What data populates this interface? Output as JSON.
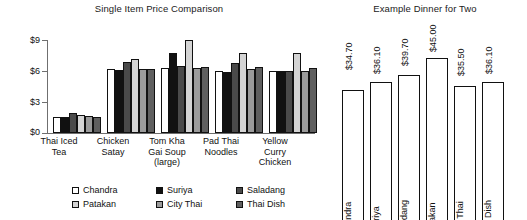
{
  "left": {
    "title": "Single Item Price Comparison",
    "y_ticks": [
      "$9",
      "$6",
      "$3",
      "$0"
    ],
    "categories": [
      "Thai Iced\nTea",
      "Chicken\nSatay",
      "Tom Kha\nGai Soup\n(large)",
      "Pad Thai\nNoodles",
      "Yellow\nCurry\nChicken"
    ],
    "legend": [
      {
        "label": "Chandra",
        "color": "#ffffff"
      },
      {
        "label": "Suriya",
        "color": "#111111"
      },
      {
        "label": "Saladang",
        "color": "#4a4a4a"
      },
      {
        "label": "Patakan",
        "color": "#d4d4d4"
      },
      {
        "label": "City Thai",
        "color": "#9b9b9b"
      },
      {
        "label": "Thai Dish",
        "color": "#5f5f5f"
      }
    ]
  },
  "right": {
    "title": "Example Dinner for Two",
    "bars": [
      {
        "name": "Chandra",
        "value_label": "$34.70",
        "value": 34.7
      },
      {
        "name": "Suriya",
        "value_label": "$36.10",
        "value": 36.1
      },
      {
        "name": "Saladang",
        "value_label": "$39.70",
        "value": 39.7
      },
      {
        "name": "Patakan",
        "value_label": "$45.00",
        "value": 45.0
      },
      {
        "name": "City Thai",
        "value_label": "$35.50",
        "value": 35.5
      },
      {
        "name": "Thai Dish",
        "value_label": "$36.10",
        "value": 36.1
      }
    ]
  },
  "chart_data": [
    {
      "type": "bar",
      "title": "Single Item Price Comparison",
      "xlabel": "",
      "ylabel": "",
      "ylim": [
        0,
        9
      ],
      "yticks": [
        0,
        3,
        6,
        9
      ],
      "ytick_labels": [
        "$0",
        "$3",
        "$6",
        "$9"
      ],
      "grid": false,
      "legend_position": "bottom",
      "categories": [
        "Thai Iced Tea",
        "Chicken Satay",
        "Tom Kha Gai Soup (large)",
        "Pad Thai Noodles",
        "Yellow Curry Chicken"
      ],
      "series": [
        {
          "name": "Chandra",
          "color": "#ffffff",
          "values": [
            1.55,
            6.2,
            6.3,
            6.0,
            5.95
          ]
        },
        {
          "name": "Suriya",
          "color": "#111111",
          "values": [
            1.55,
            6.05,
            7.75,
            5.95,
            5.95
          ]
        },
        {
          "name": "Saladang",
          "color": "#4a4a4a",
          "values": [
            1.95,
            6.85,
            6.5,
            6.8,
            5.95
          ]
        },
        {
          "name": "Patakan",
          "color": "#d4d4d4",
          "values": [
            1.75,
            7.2,
            9.0,
            7.7,
            7.75
          ]
        },
        {
          "name": "City Thai",
          "color": "#9b9b9b",
          "values": [
            1.6,
            6.2,
            6.25,
            6.15,
            5.95
          ]
        },
        {
          "name": "Thai Dish",
          "color": "#5f5f5f",
          "values": [
            1.55,
            6.2,
            6.35,
            6.35,
            6.3
          ]
        }
      ]
    },
    {
      "type": "bar",
      "title": "Example Dinner for Two",
      "xlabel": "",
      "ylabel": "",
      "grid": false,
      "legend_position": "none",
      "categories": [
        "Chandra",
        "Suriya",
        "Saladang",
        "Patakan",
        "City Thai",
        "Thai Dish"
      ],
      "values": [
        34.7,
        36.1,
        39.7,
        45.0,
        35.5,
        36.1
      ],
      "data_labels": [
        "$34.70",
        "$36.10",
        "$39.70",
        "$45.00",
        "$35.50",
        "$36.10"
      ]
    }
  ]
}
